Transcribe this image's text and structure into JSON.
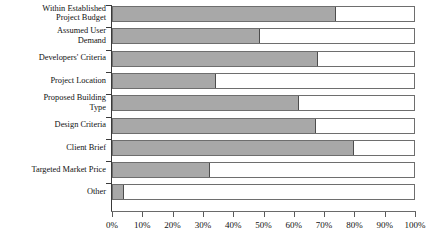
{
  "chart_data": {
    "type": "bar",
    "orientation": "horizontal",
    "stacked": true,
    "title": "",
    "xlabel": "",
    "ylabel": "",
    "xlim": [
      0,
      100
    ],
    "grid": false,
    "legend": "none",
    "axis_unit": "%",
    "categories": [
      "Within Established\nProject Budget",
      "Assumed User\nDemand",
      "Developers' Criteria",
      "Project Location",
      "Proposed Building\nType",
      "Design Criteria",
      "Client Brief",
      "Targeted Market Price",
      "Other"
    ],
    "series": [
      {
        "name": "Filled",
        "color": "#a8a8a8",
        "values": [
          73.5,
          48.5,
          67.5,
          34,
          61.5,
          67,
          79.5,
          32,
          3.5
        ]
      },
      {
        "name": "Remainder",
        "color": "#ffffff",
        "values": [
          26.5,
          51.5,
          32.5,
          66,
          38.5,
          33,
          20.5,
          68,
          96.5
        ]
      }
    ],
    "xticks": [
      0,
      10,
      20,
      30,
      40,
      50,
      60,
      70,
      80,
      90,
      100
    ],
    "xtick_labels": [
      "0%",
      "10%",
      "20%",
      "30%",
      "40%",
      "50%",
      "60%",
      "70%",
      "80%",
      "90%",
      "100%"
    ]
  }
}
